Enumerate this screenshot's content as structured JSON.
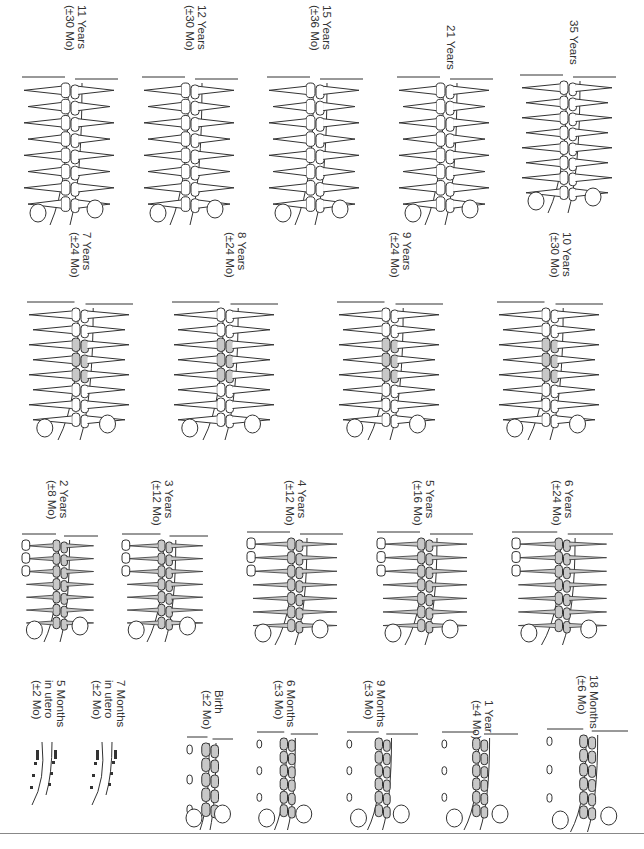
{
  "figure": {
    "rows": [
      {
        "row": 1,
        "panels": [
          {
            "age": "11 Years",
            "range": "(±30 Mo)",
            "stage": "permanent-mixed",
            "x": 20,
            "y": 5
          },
          {
            "age": "12 Years",
            "range": "(±30 Mo)",
            "stage": "permanent-mixed",
            "x": 140,
            "y": 5
          },
          {
            "age": "15 Years",
            "range": "(±36 Mo)",
            "stage": "permanent",
            "x": 270,
            "y": 5
          },
          {
            "age": "21 Years",
            "range": "",
            "stage": "permanent",
            "x": 395,
            "y": 5
          },
          {
            "age": "35 Years",
            "range": "",
            "stage": "permanent",
            "x": 520,
            "y": 5
          }
        ]
      },
      {
        "row": 2,
        "panels": [
          {
            "age": "7 Years",
            "range": "(±24 Mo)",
            "stage": "mixed",
            "x": 20,
            "y": 232
          },
          {
            "age": "8 Years",
            "range": "(±24 Mo)",
            "stage": "mixed",
            "x": 170,
            "y": 232
          },
          {
            "age": "9 Years",
            "range": "(±24 Mo)",
            "stage": "mixed",
            "x": 340,
            "y": 232
          },
          {
            "age": "10 Years",
            "range": "(±30 Mo)",
            "stage": "mixed",
            "x": 500,
            "y": 232
          }
        ]
      },
      {
        "row": 3,
        "panels": [
          {
            "age": "2 Years",
            "range": "(±8 Mo)",
            "stage": "primary",
            "x": 15,
            "y": 455
          },
          {
            "age": "3 Years",
            "range": "(±12 Mo)",
            "stage": "primary",
            "x": 125,
            "y": 455
          },
          {
            "age": "4 Years",
            "range": "(±12 Mo)",
            "stage": "primary",
            "x": 245,
            "y": 455
          },
          {
            "age": "5 Years",
            "range": "(±16 Mo)",
            "stage": "primary",
            "x": 375,
            "y": 455
          },
          {
            "age": "6 Years",
            "range": "(±24 Mo)",
            "stage": "primary",
            "x": 505,
            "y": 455
          }
        ]
      },
      {
        "row": 4,
        "panels": [
          {
            "age": "5 Months",
            "range2": "in utero",
            "range": "(±2 Mo)",
            "stage": "fetal",
            "x": 20,
            "y": 672
          },
          {
            "age": "7 Months",
            "range2": "in utero",
            "range": "(±2 Mo)",
            "stage": "fetal",
            "x": 80,
            "y": 672
          },
          {
            "age": "Birth",
            "range": "(±2 Mo)",
            "stage": "infant",
            "x": 185,
            "y": 672
          },
          {
            "age": "6 Months",
            "range": "(±3 Mo)",
            "stage": "infant",
            "x": 255,
            "y": 672
          },
          {
            "age": "9 Months",
            "range": "(±3 Mo)",
            "stage": "infant",
            "x": 345,
            "y": 672
          },
          {
            "age": "1 Year",
            "range": "(±4 Mo)",
            "stage": "infant",
            "x": 440,
            "y": 672
          },
          {
            "age": "18 Months",
            "range": "(±6 Mo)",
            "stage": "infant",
            "x": 545,
            "y": 672
          }
        ]
      }
    ]
  },
  "colors": {
    "line": "#333333",
    "stipple": "#c8c8c8",
    "rule": "#888888"
  }
}
